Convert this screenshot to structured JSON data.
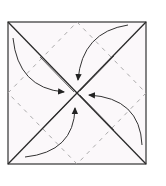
{
  "diagram": {
    "type": "origami-fold-diagram",
    "colors": {
      "background": "#ffffff",
      "paper": "#fbf8fa",
      "line": "#2a2a2a",
      "dashed": "#9a9a9a",
      "arrow": "#333333"
    },
    "square": {
      "x": 8,
      "y": 22,
      "size": 138
    },
    "dashed_diamond": [
      [
        77,
        22
      ],
      [
        146,
        93
      ],
      [
        77,
        164
      ],
      [
        8,
        93
      ]
    ],
    "arrows": [
      {
        "name": "arrow-top-left-to-center",
        "from": [
          13,
          38
        ],
        "to": [
          65,
          92
        ]
      },
      {
        "name": "arrow-top-right-to-center",
        "from": [
          128,
          25
        ],
        "to": [
          78,
          80
        ]
      },
      {
        "name": "arrow-right-to-center",
        "from": [
          142,
          145
        ],
        "to": [
          89,
          95
        ]
      },
      {
        "name": "arrow-bottom-to-center",
        "from": [
          25,
          157
        ],
        "to": [
          75,
          108
        ]
      }
    ]
  }
}
